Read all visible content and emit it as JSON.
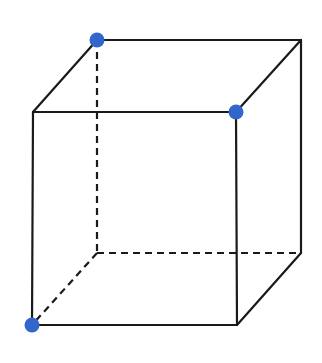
{
  "diagram": {
    "type": "cube-wireframe",
    "colors": {
      "edge": "#1a1a1a",
      "dot": "#3366cc",
      "background": "#ffffff"
    },
    "vertices": {
      "A_front_top_left": [
        33,
        112
      ],
      "B_front_top_right": [
        236,
        112
      ],
      "C_front_bottom_right": [
        237,
        325
      ],
      "D_front_bottom_left": [
        32,
        325
      ],
      "E_back_top_left": [
        97,
        40
      ],
      "F_back_top_right": [
        301,
        40
      ],
      "G_back_bottom_right": [
        301,
        253
      ],
      "H_back_bottom_left": [
        97,
        253
      ]
    },
    "solid_edges": [
      [
        "A_front_top_left",
        "B_front_top_right"
      ],
      [
        "B_front_top_right",
        "C_front_bottom_right"
      ],
      [
        "C_front_bottom_right",
        "D_front_bottom_left"
      ],
      [
        "D_front_bottom_left",
        "A_front_top_left"
      ],
      [
        "A_front_top_left",
        "E_back_top_left"
      ],
      [
        "E_back_top_left",
        "F_back_top_right"
      ],
      [
        "B_front_top_right",
        "F_back_top_right"
      ],
      [
        "F_back_top_right",
        "G_back_bottom_right"
      ],
      [
        "C_front_bottom_right",
        "G_back_bottom_right"
      ]
    ],
    "dashed_edges": [
      [
        "E_back_top_left",
        "H_back_bottom_left"
      ],
      [
        "H_back_bottom_left",
        "G_back_bottom_right"
      ],
      [
        "H_back_bottom_left",
        "D_front_bottom_left"
      ]
    ],
    "highlighted_vertices": [
      "E_back_top_left",
      "B_front_top_right",
      "D_front_bottom_left"
    ]
  }
}
